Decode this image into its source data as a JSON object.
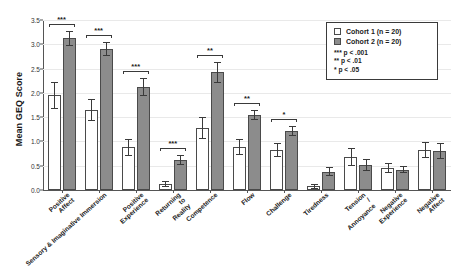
{
  "chart_data": {
    "type": "bar",
    "title": "",
    "xlabel": "",
    "ylabel": "Mean GEQ Score",
    "ylim": [
      0,
      3.5
    ],
    "yticks": [
      "0.0",
      "0.5",
      "1.0",
      "1.5",
      "2.0",
      "2.5",
      "3.0",
      "3.5"
    ],
    "grid": true,
    "legend_position": "top-right",
    "categories": [
      "Positive Affect",
      "Sensory & Imaginative Immersion",
      "Positive Experience",
      "Returning to Reality",
      "Competence",
      "Flow",
      "Challenge",
      "Tiredness",
      "Tension / Annoyance",
      "Negative Experience",
      "Negative Affect"
    ],
    "series": [
      {
        "name": "Cohort 1 (n = 20)",
        "color": "#ffffff",
        "values": [
          1.95,
          1.65,
          0.88,
          0.12,
          1.28,
          0.88,
          0.82,
          0.08,
          0.68,
          0.45,
          0.82
        ],
        "errors": [
          0.28,
          0.22,
          0.18,
          0.06,
          0.22,
          0.16,
          0.14,
          0.05,
          0.18,
          0.1,
          0.16
        ]
      },
      {
        "name": "Cohort 2 (n = 20)",
        "color": "#8c8c8c",
        "values": [
          3.12,
          2.9,
          2.12,
          0.62,
          2.42,
          1.55,
          1.22,
          0.38,
          0.52,
          0.42,
          0.8
        ],
        "errors": [
          0.16,
          0.14,
          0.18,
          0.1,
          0.22,
          0.1,
          0.1,
          0.1,
          0.12,
          0.08,
          0.16
        ]
      }
    ],
    "significance": [
      {
        "category": "Positive Affect",
        "marker": "***"
      },
      {
        "category": "Sensory & Imaginative Immersion",
        "marker": "***"
      },
      {
        "category": "Positive Experience",
        "marker": "***"
      },
      {
        "category": "Returning to Reality",
        "marker": "***"
      },
      {
        "category": "Competence",
        "marker": "**"
      },
      {
        "category": "Flow",
        "marker": "**"
      },
      {
        "category": "Challenge",
        "marker": "*"
      },
      {
        "category": "Tiredness",
        "marker": ""
      },
      {
        "category": "Tension / Annoyance",
        "marker": ""
      },
      {
        "category": "Negative Experience",
        "marker": ""
      },
      {
        "category": "Negative Affect",
        "marker": ""
      }
    ]
  },
  "legend": {
    "entries": [
      {
        "label": "Cohort 1 (n = 20)",
        "swatch": "c1"
      },
      {
        "label": "Cohort 2 (n = 20)",
        "swatch": "c2"
      }
    ],
    "notes": [
      "*** p < .001",
      "** p < .01",
      "* p < .05"
    ]
  },
  "axis": {
    "y_title": "Mean GEQ Score"
  }
}
